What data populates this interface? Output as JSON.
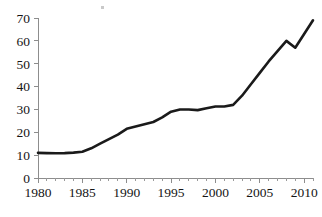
{
  "chart_data": {
    "type": "line",
    "title": "",
    "subtitle": "",
    "xlabel": "",
    "ylabel": "",
    "xlim": [
      1980,
      2011
    ],
    "ylim": [
      0,
      70
    ],
    "grid": false,
    "legend": false,
    "y_ticks": [
      0,
      10,
      20,
      30,
      40,
      50,
      60,
      70
    ],
    "y_tick_labels": [
      "0",
      "10",
      "20",
      "30",
      "40",
      "50",
      "60",
      "70"
    ],
    "x_ticks": [
      1980,
      1985,
      1990,
      1995,
      2000,
      2005,
      2010
    ],
    "x_tick_labels": [
      "1980",
      "1985",
      "1990",
      "1995",
      "2000",
      "2005",
      "2010"
    ],
    "x_minor_tick_interval": 1,
    "line_color": "#1a1a1a",
    "axis_color": "#8d8d8d",
    "x": [
      1980,
      1981,
      1982,
      1983,
      1984,
      1985,
      1986,
      1987,
      1988,
      1989,
      1990,
      1991,
      1992,
      1993,
      1994,
      1995,
      1996,
      1997,
      1998,
      1999,
      2000,
      2001,
      2002,
      2003,
      2004,
      2005,
      2006,
      2007,
      2008,
      2009,
      2010,
      2011
    ],
    "values": [
      11.0,
      10.9,
      10.8,
      10.9,
      11.1,
      11.5,
      13.0,
      15.0,
      17.0,
      19.0,
      21.5,
      22.5,
      23.5,
      24.5,
      26.5,
      29.0,
      30.0,
      30.0,
      29.7,
      30.5,
      31.3,
      31.3,
      32.0,
      36.0,
      41.0,
      46.0,
      51.0,
      55.5,
      60.0,
      57.0,
      63.0,
      69.0
    ],
    "series": [
      {
        "name": "series-1",
        "values": [
          11.0,
          10.9,
          10.8,
          10.9,
          11.1,
          11.5,
          13.0,
          15.0,
          17.0,
          19.0,
          21.5,
          22.5,
          23.5,
          24.5,
          26.5,
          29.0,
          30.0,
          30.0,
          29.7,
          30.5,
          31.3,
          31.3,
          32.0,
          36.0,
          41.0,
          46.0,
          51.0,
          55.5,
          60.0,
          57.0,
          63.0,
          69.0
        ]
      }
    ],
    "annotations": []
  },
  "geometry": {
    "plot_left": 38,
    "plot_right": 313,
    "plot_top": 18,
    "plot_bottom": 178,
    "x_axis_year_start": 1980,
    "x_axis_year_end": 2011
  }
}
